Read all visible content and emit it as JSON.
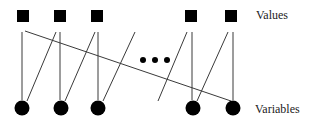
{
  "labels": {
    "values": "Values",
    "variables": "Variables"
  },
  "colors": {
    "node": "#000000",
    "edge": "#3a3a3a",
    "text": "#222222"
  },
  "value_nodes": [
    {
      "shape": "square",
      "x": 23,
      "y": 16
    },
    {
      "shape": "square",
      "x": 60,
      "y": 16
    },
    {
      "shape": "square",
      "x": 97,
      "y": 16
    },
    {
      "shape": "square",
      "x": 191,
      "y": 16
    },
    {
      "shape": "square",
      "x": 231,
      "y": 16
    }
  ],
  "variable_nodes": [
    {
      "shape": "circle",
      "x": 22,
      "y": 108
    },
    {
      "shape": "circle",
      "x": 61,
      "y": 108
    },
    {
      "shape": "circle",
      "x": 98,
      "y": 108
    },
    {
      "shape": "circle",
      "x": 193,
      "y": 108
    },
    {
      "shape": "circle",
      "x": 233,
      "y": 108
    }
  ],
  "edges": [
    {
      "x1": 22,
      "y1": 32,
      "x2": 22,
      "y2": 100
    },
    {
      "x1": 60,
      "y1": 32,
      "x2": 60,
      "y2": 100
    },
    {
      "x1": 98,
      "y1": 32,
      "x2": 98,
      "y2": 100
    },
    {
      "x1": 192,
      "y1": 32,
      "x2": 192,
      "y2": 100
    },
    {
      "x1": 233,
      "y1": 32,
      "x2": 233,
      "y2": 100
    },
    {
      "x1": 56,
      "y1": 32,
      "x2": 27,
      "y2": 101
    },
    {
      "x1": 95,
      "y1": 32,
      "x2": 65,
      "y2": 101
    },
    {
      "x1": 135,
      "y1": 32,
      "x2": 103,
      "y2": 101
    },
    {
      "x1": 187,
      "y1": 32,
      "x2": 158,
      "y2": 101
    },
    {
      "x1": 228,
      "y1": 32,
      "x2": 197,
      "y2": 101
    },
    {
      "x1": 25,
      "y1": 31,
      "x2": 231,
      "y2": 101
    }
  ],
  "ellipsis_dots": [
    {
      "x": 143,
      "y": 60
    },
    {
      "x": 155,
      "y": 60
    },
    {
      "x": 167,
      "y": 60
    }
  ]
}
